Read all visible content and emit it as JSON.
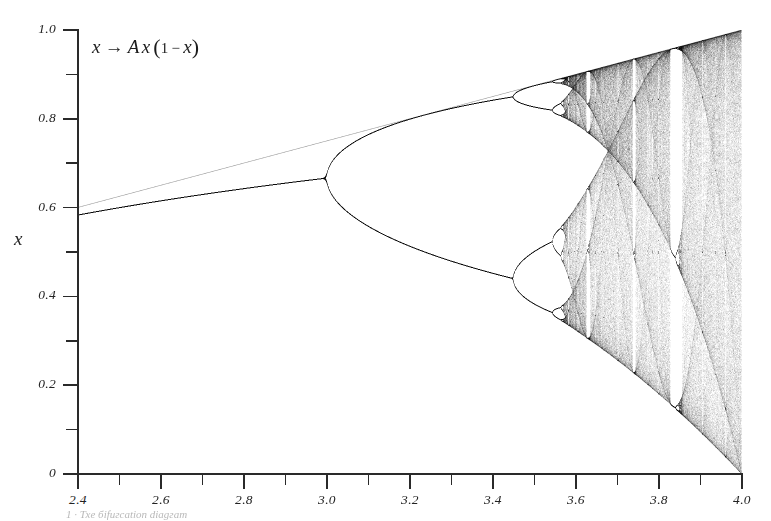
{
  "figure": {
    "formula": {
      "var_x": "x",
      "arrow": "→",
      "param": "A",
      "var_x2": "x",
      "open": "(",
      "one": "1",
      "minus": "−",
      "var_x3": "x",
      "close": ")",
      "plain": "x → A x (1 − x)"
    },
    "ylabel": "x",
    "caption": "1  ·  Тхе біfuгcаtіon dіаgгаm"
  },
  "axes": {
    "x": {
      "min": 2.4,
      "max": 4.0,
      "major_ticks": [
        2.4,
        2.6,
        2.8,
        3.0,
        3.2,
        3.4,
        3.6,
        3.8,
        4.0
      ],
      "major_labels": [
        "2.4",
        "2.6",
        "2.8",
        "3.0",
        "3.2",
        "3.4",
        "3.6",
        "3.8",
        "4.0"
      ],
      "minor_ticks": [
        2.5,
        2.7,
        2.9,
        3.1,
        3.3,
        3.5,
        3.7,
        3.9
      ]
    },
    "y": {
      "min": 0.0,
      "max": 1.0,
      "major_ticks": [
        0.0,
        0.2,
        0.4,
        0.6,
        0.8,
        1.0
      ],
      "major_labels": [
        "0",
        "0.2",
        "0.4",
        "0.6",
        "0.8",
        "1.0"
      ],
      "minor_ticks": [
        0.1,
        0.3,
        0.5,
        0.7,
        0.9
      ]
    }
  },
  "colors": {
    "background": "#ffffff",
    "axis": "#2a2a2a",
    "ink": "#1a1a1a",
    "label": "#222222"
  },
  "chart_data": {
    "type": "scatter",
    "xlabel": "A",
    "ylabel": "x",
    "xlim": [
      2.4,
      4.0
    ],
    "ylim": [
      0.0,
      1.0
    ],
    "grid": false,
    "legend": null,
    "map": "x -> A*x*(1-x)",
    "render": {
      "a_steps": 1328,
      "transient_iterations": 400,
      "plot_iterations": 420,
      "x0": 0.31,
      "point_alpha": 0.16
    },
    "annotations": [
      {
        "text": "x → A x (1 − x)",
        "x": 2.43,
        "y": 0.955
      }
    ],
    "features": [
      {
        "name": "fixed-point-branch",
        "a_range": [
          2.4,
          3.0
        ],
        "x_at_a_min": 0.5833,
        "x_at_a_max": 0.6667,
        "period": 1
      },
      {
        "name": "period-2-bifurcation",
        "a": 3.0,
        "period": 2
      },
      {
        "name": "period-4-bifurcation",
        "a": 3.449,
        "period": 4
      },
      {
        "name": "period-8-bifurcation",
        "a": 3.544,
        "period": 8
      },
      {
        "name": "period-16-bifurcation",
        "a": 3.5644,
        "period": 16
      },
      {
        "name": "accumulation-onset-of-chaos",
        "a": 3.5699,
        "period": null
      },
      {
        "name": "period-3-window",
        "a_range": [
          3.8284,
          3.8415
        ],
        "period": 3
      },
      {
        "name": "period-5-window",
        "a_range": [
          3.7382,
          3.7442
        ],
        "period": 5
      },
      {
        "name": "period-6-window",
        "a_range": [
          3.6265,
          3.6304
        ],
        "period": 6
      },
      {
        "name": "upper-envelope",
        "formula": "A/4"
      },
      {
        "name": "lower-envelope",
        "formula": "(A/4)*A*(1-A/4)"
      }
    ],
    "sample_points": [
      {
        "a": 2.4,
        "x": [
          0.5833
        ]
      },
      {
        "a": 2.6,
        "x": [
          0.6154
        ]
      },
      {
        "a": 2.8,
        "x": [
          0.6429
        ]
      },
      {
        "a": 3.0,
        "x": [
          0.6667
        ]
      },
      {
        "a": 3.2,
        "x": [
          0.513,
          0.7995
        ]
      },
      {
        "a": 3.4,
        "x": [
          0.452,
          0.8422
        ]
      },
      {
        "a": 3.5,
        "x": [
          0.3828,
          0.5009,
          0.8269,
          0.875
        ]
      },
      {
        "a": 3.55,
        "x": [
          0.3548,
          0.373,
          0.506,
          0.5405,
          0.8126,
          0.827,
          0.8817,
          0.8874
        ]
      },
      {
        "a": 3.6,
        "x": [
          0.3239,
          0.8999
        ]
      },
      {
        "a": 3.7,
        "x": [
          0.2475,
          0.925
        ]
      },
      {
        "a": 3.83,
        "x": [
          0.1561,
          0.5046,
          0.9574
        ]
      },
      {
        "a": 3.9,
        "x": [
          0.095,
          0.975
        ]
      },
      {
        "a": 4.0,
        "x": [
          0.0,
          1.0
        ]
      }
    ]
  }
}
